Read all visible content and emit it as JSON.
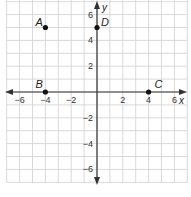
{
  "graph": {
    "x_axis_label": "x",
    "y_axis_label": "y",
    "x_ticks": [
      {
        "value": -6,
        "label": "−6"
      },
      {
        "value": -4,
        "label": "−4"
      },
      {
        "value": -2,
        "label": "−2"
      },
      {
        "value": 2,
        "label": "2"
      },
      {
        "value": 4,
        "label": "4"
      },
      {
        "value": 6,
        "label": "6"
      }
    ],
    "y_ticks": [
      {
        "value": 6,
        "label": "6"
      },
      {
        "value": 4,
        "label": "4"
      },
      {
        "value": 2,
        "label": "2"
      },
      {
        "value": -2,
        "label": "−2"
      },
      {
        "value": -4,
        "label": "−4"
      },
      {
        "value": -6,
        "label": "−6"
      }
    ],
    "points": [
      {
        "name": "A",
        "x": -4,
        "y": 5
      },
      {
        "name": "B",
        "x": -4,
        "y": 0
      },
      {
        "name": "C",
        "x": 4,
        "y": 0
      },
      {
        "name": "D",
        "x": 0,
        "y": 5
      }
    ],
    "colors": {
      "grid": "#cfcfcf",
      "axis": "#333333",
      "point": "#111111"
    }
  }
}
